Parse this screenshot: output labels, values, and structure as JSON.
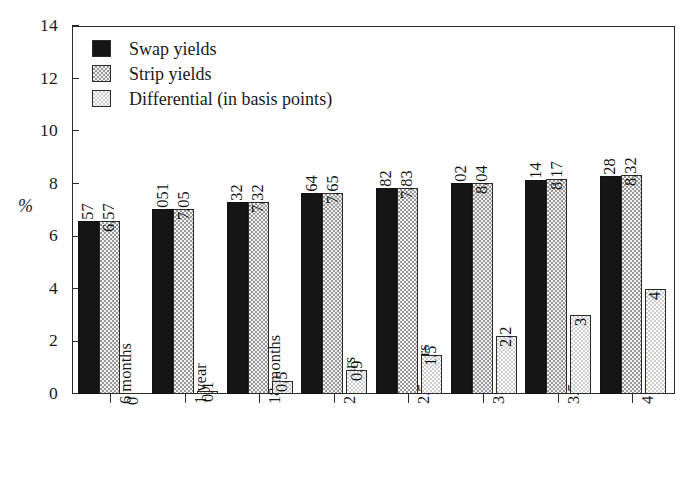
{
  "chart_data": {
    "type": "bar",
    "title": "",
    "xlabel": "",
    "ylabel": "%",
    "ylim": [
      0,
      14
    ],
    "ytick_values": [
      14,
      12,
      10,
      8,
      6,
      4,
      2,
      0
    ],
    "ytick_labels": [
      "14",
      "12",
      "10",
      "8",
      "6",
      "4",
      "2",
      "0"
    ],
    "grid": false,
    "legend_position": "upper-left-inside",
    "categories": [
      "6 months",
      "1 year",
      "18 months",
      "2 years",
      "2.5 years",
      "3 years",
      "3.5 years",
      "4 years"
    ],
    "series": [
      {
        "name": "Swap yields",
        "swatch": "solid-black",
        "values": [
          6.57,
          7.051,
          7.32,
          7.64,
          7.82,
          8.02,
          8.14,
          8.28
        ],
        "labels": [
          "6.57",
          "7.051",
          "7.32",
          "7.64",
          "7.82",
          "8.02",
          "8.14",
          "8.28"
        ]
      },
      {
        "name": "Strip yields",
        "swatch": "medium-dotted",
        "values": [
          6.57,
          7.05,
          7.32,
          7.65,
          7.83,
          8.04,
          8.17,
          8.32
        ],
        "labels": [
          "6.57",
          "7.05",
          "7.32",
          "7.65",
          "7.83",
          "8.04",
          "8.17",
          "8.32"
        ]
      },
      {
        "name": "Differential (in basis points)",
        "swatch": "light-dotted",
        "values": [
          0,
          0.1,
          0.5,
          0.9,
          1.5,
          2.2,
          3,
          4
        ],
        "labels": [
          "0",
          "0.1",
          "0.5",
          "0.9",
          "1.5",
          "2.2",
          "3",
          "4"
        ]
      }
    ]
  },
  "legend": {
    "items": [
      {
        "label": "Swap yields",
        "swatch": "solid-black"
      },
      {
        "label": "Strip yields",
        "swatch": "medium-dotted"
      },
      {
        "label": "Differential (in basis points)",
        "swatch": "light-dotted"
      }
    ]
  },
  "axes": {
    "y_label": "%",
    "y_ticks": [
      "14",
      "12",
      "10",
      "8",
      "6",
      "4",
      "2",
      "0"
    ],
    "x_ticks": [
      "6 months",
      "1 year",
      "18 months",
      "2 years",
      "2.5 years",
      "3 years",
      "3.5 years",
      "4 years"
    ]
  },
  "colors": {
    "axis": "#2a2a2a",
    "swap_fill": "#151515",
    "strip_fill": "#e2e2e2",
    "differential_fill": "#f0f0f0",
    "background": "#ffffff",
    "text": "#1a1a1a"
  }
}
